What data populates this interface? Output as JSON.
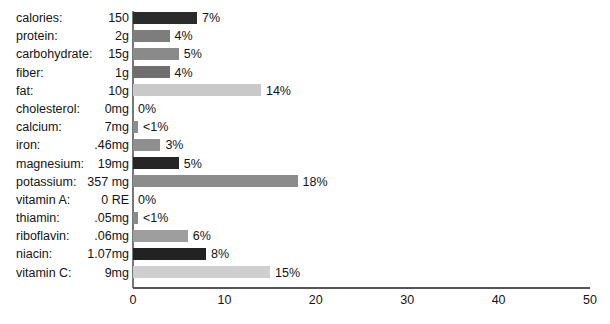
{
  "chart_data": {
    "type": "bar",
    "orientation": "horizontal",
    "title": "",
    "xlabel": "",
    "ylabel": "",
    "xlim": [
      0,
      50
    ],
    "xticks": [
      0,
      10,
      20,
      30,
      40,
      50
    ],
    "grid": false,
    "legend": false,
    "categories": [
      "calories:",
      "protein:",
      "carbohydrate:",
      "fiber:",
      "fat:",
      "cholesterol:",
      "calcium:",
      "iron:",
      "magnesium:",
      "potassium:",
      "vitamin A:",
      "thiamin:",
      "riboflavin:",
      "niacin:",
      "vitamin C:"
    ],
    "amounts": [
      "150",
      "2g",
      "15g",
      "1g",
      "10g",
      "0mg",
      "7mg",
      ".46mg",
      "19mg",
      "357 mg",
      "0 RE",
      ".05mg",
      ".06mg",
      "1.07mg",
      "9mg"
    ],
    "values": [
      7,
      4,
      5,
      4,
      14,
      0,
      0.7,
      3,
      5,
      18,
      0,
      0.7,
      6,
      8,
      15
    ],
    "value_labels": [
      "7%",
      "4%",
      "5%",
      "4%",
      "14%",
      "0%",
      "<1%",
      "3%",
      "5%",
      "18%",
      "0%",
      "<1%",
      "6%",
      "8%",
      "15%"
    ],
    "bar_colors": [
      "#2b2b2b",
      "#7d7d7d",
      "#8a8a8a",
      "#6e6e6e",
      "#c9c9c9",
      "#9a9a9a",
      "#8d8d8d",
      "#8f8f8f",
      "#262626",
      "#8c8c8c",
      "#9a9a9a",
      "#8a8a8a",
      "#9e9e9e",
      "#222222",
      "#cfcfcf"
    ]
  },
  "rows": [
    {
      "label": "calories:",
      "amount": "150",
      "value": 7,
      "pct": "7%",
      "color": "#2b2b2b"
    },
    {
      "label": "protein:",
      "amount": "2g",
      "value": 4,
      "pct": "4%",
      "color": "#7d7d7d"
    },
    {
      "label": "carbohydrate:",
      "amount": "15g",
      "value": 5,
      "pct": "5%",
      "color": "#8a8a8a"
    },
    {
      "label": "fiber:",
      "amount": "1g",
      "value": 4,
      "pct": "4%",
      "color": "#6e6e6e"
    },
    {
      "label": "fat:",
      "amount": "10g",
      "value": 14,
      "pct": "14%",
      "color": "#c9c9c9"
    },
    {
      "label": "cholesterol:",
      "amount": "0mg",
      "value": 0,
      "pct": "0%",
      "color": "#9a9a9a"
    },
    {
      "label": "calcium:",
      "amount": "7mg",
      "value": 0.55,
      "pct": "<1%",
      "color": "#8d8d8d"
    },
    {
      "label": "iron:",
      "amount": ".46mg",
      "value": 3,
      "pct": "3%",
      "color": "#8f8f8f"
    },
    {
      "label": "magnesium:",
      "amount": "19mg",
      "value": 5,
      "pct": "5%",
      "color": "#262626"
    },
    {
      "label": "potassium:",
      "amount": "357 mg",
      "value": 18,
      "pct": "18%",
      "color": "#8c8c8c"
    },
    {
      "label": "vitamin A:",
      "amount": "0 RE",
      "value": 0,
      "pct": "0%",
      "color": "#9a9a9a"
    },
    {
      "label": "thiamin:",
      "amount": ".05mg",
      "value": 0.55,
      "pct": "<1%",
      "color": "#8a8a8a"
    },
    {
      "label": "riboflavin:",
      "amount": ".06mg",
      "value": 6,
      "pct": "6%",
      "color": "#9e9e9e"
    },
    {
      "label": "niacin:",
      "amount": "1.07mg",
      "value": 8,
      "pct": "8%",
      "color": "#222222"
    },
    {
      "label": "vitamin C:",
      "amount": "9mg",
      "value": 15,
      "pct": "15%",
      "color": "#cfcfcf"
    }
  ],
  "axis": {
    "ticks": [
      "0",
      "10",
      "20",
      "30",
      "40",
      "50"
    ],
    "min": 0,
    "max": 50
  },
  "title_sliver": ""
}
